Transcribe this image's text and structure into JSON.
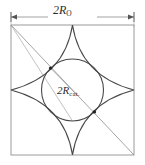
{
  "figure": {
    "type": "geometry-diagram",
    "outer_dimension": {
      "prefix": "2",
      "variable": "R",
      "subscript": "O",
      "full_label": "2R_O"
    },
    "inner_dimension": {
      "prefix": "2",
      "variable": "R",
      "subscript": "cat.",
      "full_label": "2R_cat."
    },
    "colors": {
      "stroke": "#3a3a3a",
      "thin_stroke": "#8a8a8a",
      "background": "#ffffff",
      "text": "#2b2b2b"
    },
    "geometry": {
      "square": {
        "left": 11,
        "top": 25,
        "right": 134,
        "bottom": 155
      },
      "circle": {
        "cx": 72.5,
        "cy": 90,
        "r": 31
      },
      "astroid_cusps": [
        "top",
        "right",
        "bottom",
        "left"
      ],
      "diagonal": {
        "from": "top-left-corner",
        "to": "bottom-right-corner"
      },
      "dimension_line": {
        "y": 17,
        "x1": 11,
        "x2": 134,
        "ticks": "both-ends"
      },
      "marker_dots": [
        {
          "x": 50.6,
          "y": 68.1
        },
        {
          "x": 94.4,
          "y": 111.9
        }
      ]
    }
  }
}
